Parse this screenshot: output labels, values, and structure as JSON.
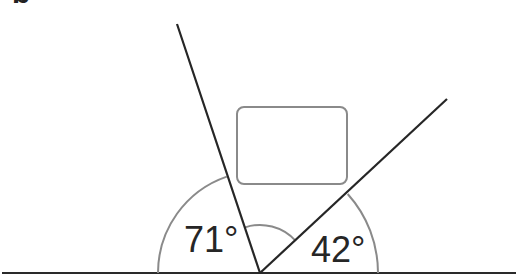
{
  "figure": {
    "panel_label": "b",
    "angles": [
      {
        "id": "left",
        "value": 71,
        "text": "71°"
      },
      {
        "id": "right",
        "value": 42,
        "text": "42°"
      }
    ],
    "colors": {
      "ray": "#262626",
      "arc": "#8a8a8a",
      "rectangle": "#8a8a8a",
      "baseline": "#2a2a2a",
      "background": "#ffffff"
    },
    "elements": {
      "baseline": "horizontal ground line",
      "left_ray": "ray at 109° from baseline (71° to left of it)",
      "right_ray": "ray at 42° from baseline",
      "rectangle": "rounded rectangle between the rays",
      "outer_arcs": "angle arcs marking 71° and 42°",
      "inner_arc": "arc marking the unlabeled angle between the rays"
    }
  }
}
